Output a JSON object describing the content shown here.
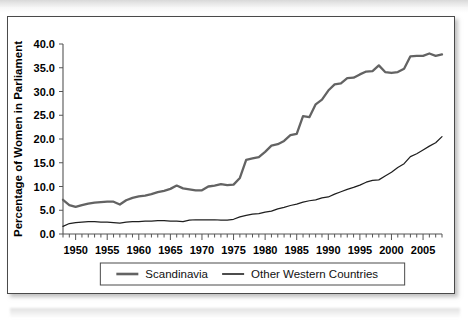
{
  "figure": {
    "background_color": "#ffffff",
    "frame_color": "#4a4a4a"
  },
  "chart_data": {
    "type": "line",
    "title": "",
    "xlabel": "",
    "ylabel": "Percentage of  Women in Parliament",
    "xlim": [
      1948,
      2008
    ],
    "ylim": [
      0.0,
      40.0
    ],
    "grid": false,
    "legend_position": "bottom",
    "ytick_labels": [
      "0.0",
      "5.0",
      "10.0",
      "15.0",
      "20.0",
      "25.0",
      "30.0",
      "35.0",
      "40.0"
    ],
    "ytick_values": [
      0,
      5,
      10,
      15,
      20,
      25,
      30,
      35,
      40
    ],
    "xtick_labels": [
      "1950",
      "1955",
      "1960",
      "1965",
      "1970",
      "1975",
      "1980",
      "1985",
      "1990",
      "1995",
      "2000",
      "2005"
    ],
    "xtick_values": [
      1950,
      1955,
      1960,
      1965,
      1970,
      1975,
      1980,
      1985,
      1990,
      1995,
      2000,
      2005
    ],
    "x": [
      1948,
      1949,
      1950,
      1951,
      1952,
      1953,
      1954,
      1955,
      1956,
      1957,
      1958,
      1959,
      1960,
      1961,
      1962,
      1963,
      1964,
      1965,
      1966,
      1967,
      1968,
      1969,
      1970,
      1971,
      1972,
      1973,
      1974,
      1975,
      1976,
      1977,
      1978,
      1979,
      1980,
      1981,
      1982,
      1983,
      1984,
      1985,
      1986,
      1987,
      1988,
      1989,
      1990,
      1991,
      1992,
      1993,
      1994,
      1995,
      1996,
      1997,
      1998,
      1999,
      2000,
      2001,
      2002,
      2003,
      2004,
      2005,
      2006,
      2007,
      2008
    ],
    "series": [
      {
        "name": "Scandinavia",
        "color": "#636363",
        "line_width": 2.3,
        "values": [
          7.2,
          6.1,
          5.7,
          6.1,
          6.4,
          6.6,
          6.7,
          6.8,
          6.8,
          6.2,
          7.1,
          7.6,
          7.9,
          8.1,
          8.4,
          8.8,
          9.1,
          9.5,
          10.2,
          9.6,
          9.4,
          9.2,
          9.2,
          10.0,
          10.2,
          10.5,
          10.3,
          10.4,
          11.8,
          15.6,
          15.9,
          16.2,
          17.3,
          18.6,
          18.9,
          19.6,
          20.8,
          21.1,
          24.8,
          24.6,
          27.3,
          28.3,
          30.2,
          31.5,
          31.7,
          32.8,
          32.9,
          33.6,
          34.2,
          34.3,
          35.5,
          34.1,
          33.9,
          34.1,
          34.8,
          37.4,
          37.5,
          37.5,
          38.0,
          37.5,
          37.8
        ]
      },
      {
        "name": "Other Western Countries",
        "color": "#1f1f1f",
        "line_width": 1.25,
        "values": [
          1.6,
          2.2,
          2.4,
          2.5,
          2.6,
          2.6,
          2.5,
          2.5,
          2.4,
          2.3,
          2.5,
          2.6,
          2.6,
          2.7,
          2.7,
          2.8,
          2.8,
          2.7,
          2.7,
          2.6,
          2.9,
          3.0,
          3.0,
          3.0,
          3.0,
          2.9,
          2.9,
          3.1,
          3.6,
          3.9,
          4.2,
          4.3,
          4.6,
          4.8,
          5.3,
          5.6,
          6.0,
          6.3,
          6.7,
          7.0,
          7.2,
          7.6,
          7.8,
          8.4,
          8.9,
          9.4,
          9.8,
          10.3,
          10.9,
          11.3,
          11.4,
          12.2,
          13.0,
          14.0,
          14.8,
          16.3,
          16.9,
          17.7,
          18.5,
          19.2,
          20.5
        ]
      }
    ]
  },
  "legend": {
    "items": [
      {
        "label": "Scandinavia",
        "color": "#636363"
      },
      {
        "label": "Other Western Countries",
        "color": "#1f1f1f"
      }
    ]
  }
}
